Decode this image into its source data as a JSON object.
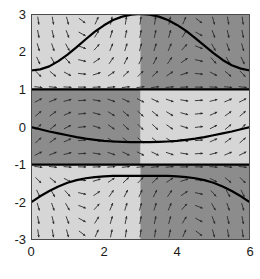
{
  "chart_data": {
    "type": "line",
    "title": "",
    "xlabel": "",
    "ylabel": "",
    "xlim": [
      0,
      6
    ],
    "ylim": [
      -3,
      3
    ],
    "grid": false,
    "legend": null,
    "xticks": [
      0,
      2,
      4,
      6
    ],
    "yticks": [
      3,
      2,
      1,
      0,
      -1,
      -2,
      -3
    ],
    "xtick_labels": [
      "0",
      "2",
      "4",
      "6"
    ],
    "ytick_labels": [
      "3",
      "2",
      "1",
      "0",
      "-1",
      "-2",
      "-3"
    ],
    "background_shading": {
      "light_color": "#d6d6d6",
      "dark_color": "#8c8c8c",
      "split_x": 3,
      "bands": [
        {
          "y_range": [
            1,
            3
          ],
          "left_shade": "light",
          "right_shade": "dark"
        },
        {
          "y_range": [
            -1,
            1
          ],
          "left_shade": "dark",
          "right_shade": "light"
        },
        {
          "y_range": [
            -3,
            -1
          ],
          "left_shade": "light",
          "right_shade": "dark"
        }
      ]
    },
    "equilibrium_lines": [
      {
        "name": "y = 1",
        "y": 1,
        "color": "#000000"
      },
      {
        "name": "y = -1",
        "y": -1,
        "color": "#000000"
      }
    ],
    "series": [
      {
        "name": "upper-solution",
        "color": "#000000",
        "x": [
          0,
          0.25,
          0.5,
          0.75,
          1,
          1.25,
          1.5,
          1.75,
          2,
          2.25,
          2.5,
          2.75,
          3,
          3.25,
          3.5,
          3.75,
          4,
          4.25,
          4.5,
          4.75,
          5,
          5.25,
          5.5,
          5.75,
          6
        ],
        "values": [
          1.5,
          1.53,
          1.61,
          1.75,
          1.92,
          2.12,
          2.33,
          2.53,
          2.7,
          2.84,
          2.93,
          2.98,
          3.0,
          2.98,
          2.93,
          2.84,
          2.71,
          2.55,
          2.36,
          2.16,
          1.96,
          1.78,
          1.64,
          1.55,
          1.5
        ]
      },
      {
        "name": "middle-solution",
        "color": "#000000",
        "x": [
          0,
          0.25,
          0.5,
          0.75,
          1,
          1.25,
          1.5,
          1.75,
          2,
          2.25,
          2.5,
          2.75,
          3,
          3.25,
          3.5,
          3.75,
          4,
          4.25,
          4.5,
          4.75,
          5,
          5.25,
          5.5,
          5.75,
          6
        ],
        "values": [
          0.0,
          -0.06,
          -0.12,
          -0.17,
          -0.22,
          -0.27,
          -0.31,
          -0.34,
          -0.37,
          -0.385,
          -0.395,
          -0.4,
          -0.4,
          -0.4,
          -0.395,
          -0.385,
          -0.37,
          -0.34,
          -0.31,
          -0.27,
          -0.22,
          -0.17,
          -0.12,
          -0.06,
          0.0
        ]
      },
      {
        "name": "lower-solution",
        "color": "#000000",
        "x": [
          0,
          0.25,
          0.5,
          0.75,
          1,
          1.25,
          1.5,
          1.75,
          2,
          2.25,
          2.5,
          2.75,
          3,
          3.25,
          3.5,
          3.75,
          4,
          4.25,
          4.5,
          4.75,
          5,
          5.25,
          5.5,
          5.75,
          6
        ],
        "values": [
          -2.0,
          -1.84,
          -1.7,
          -1.58,
          -1.48,
          -1.41,
          -1.36,
          -1.33,
          -1.31,
          -1.3,
          -1.3,
          -1.3,
          -1.3,
          -1.3,
          -1.3,
          -1.3,
          -1.31,
          -1.33,
          -1.36,
          -1.41,
          -1.48,
          -1.58,
          -1.7,
          -1.84,
          -2.0
        ]
      }
    ],
    "vector_field": {
      "style": "arrows",
      "color": "#2b2b2b",
      "nx": 15,
      "ny": 17,
      "slope_formula": "dy/dx = (1 - y^2) * cos(pi*x/3)"
    }
  }
}
